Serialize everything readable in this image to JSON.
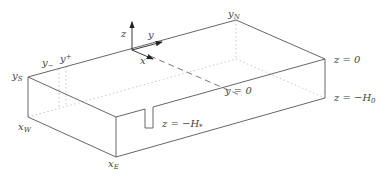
{
  "diagram": {
    "type": "3d-box-domain",
    "colors": {
      "line": "#555555",
      "hidden": "#bbbbbb",
      "text": "#444444"
    },
    "labels": {
      "y_n": "y",
      "y_n_sub": "N",
      "y_s": "y",
      "y_s_sub": "S",
      "y_minus": "y",
      "y_minus_sub": "−",
      "y_plus": "y",
      "y_plus_sub": "+",
      "x_w": "x",
      "x_w_sub": "W",
      "x_e": "x",
      "x_e_sub": "E",
      "axis_z": "z",
      "axis_y": "y",
      "axis_x": "x",
      "z_top": "z = 0",
      "z_bottom_left": "z = −H",
      "z_bottom_left_sub": "0",
      "z_notch": "z = −H",
      "z_notch_sub": "*",
      "y_zero": "y = 0"
    }
  }
}
